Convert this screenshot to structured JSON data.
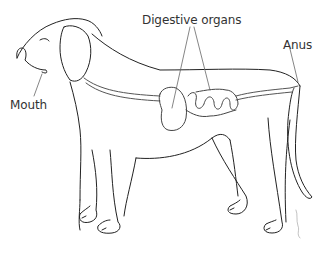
{
  "diagram": {
    "labels": {
      "digestive_organs": "Digestive organs",
      "anus": "Anus",
      "mouth": "Mouth"
    },
    "colors": {
      "line": "#222222",
      "tract": "#555555",
      "label": "#333333",
      "background": "#ffffff"
    }
  }
}
